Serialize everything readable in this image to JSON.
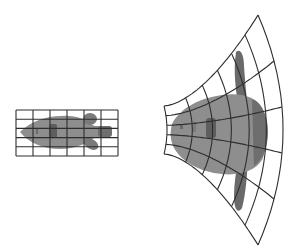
{
  "figure": {
    "colors": {
      "background": "#ffffff",
      "grid_line": "#333333",
      "body_fill": "#8a8a8a",
      "fin_fill": "#6a6a6a",
      "spot_fill": "#5a5a5a"
    },
    "original_grid": {
      "x0": 16,
      "y0": 110,
      "width": 102,
      "height": 46,
      "columns": 6,
      "rows": 5
    },
    "transformed_grid": {
      "columns": 6,
      "rows": 5,
      "inner_arc": {
        "x": 167,
        "y_top": 105,
        "y_bottom": 153
      },
      "outer_arc": {
        "x": 283,
        "y_top": 10,
        "y_bottom": 240
      }
    }
  }
}
